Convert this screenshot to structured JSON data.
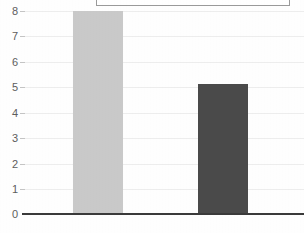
{
  "chart_data": {
    "type": "bar",
    "title": "",
    "subtitle": "",
    "xlabel": "",
    "ylabel": "",
    "categories": [
      "",
      ""
    ],
    "values": [
      8.0,
      5.1
    ],
    "series": [
      {
        "name": "",
        "values": [
          8.0,
          5.1
        ]
      }
    ],
    "ylim": [
      0,
      8
    ],
    "yticks": [
      0,
      1,
      2,
      3,
      4,
      5,
      6,
      7,
      8
    ],
    "ytick_labels": [
      "0",
      "1",
      "2",
      "3",
      "4",
      "5",
      "6",
      "7",
      "8"
    ],
    "grid": true,
    "legend_position": "top",
    "bar_colors": [
      "#c9c9c9",
      "#4a4a4a"
    ],
    "annotations": []
  },
  "axis": {
    "y_labels": [
      "8",
      "7",
      "6",
      "5",
      "4",
      "3",
      "2",
      "1",
      "0"
    ],
    "baseline_color": "#3a3a3a",
    "gridline_color": "#ededed"
  },
  "legend": {
    "visible": true,
    "cropped": true,
    "border_color": "#9a9a9a",
    "items": []
  },
  "colors": {
    "background": "#fefefe",
    "bar_light": "#c9c9c9",
    "bar_dark": "#4a4a4a",
    "tick_text": "#5d5d5d"
  }
}
